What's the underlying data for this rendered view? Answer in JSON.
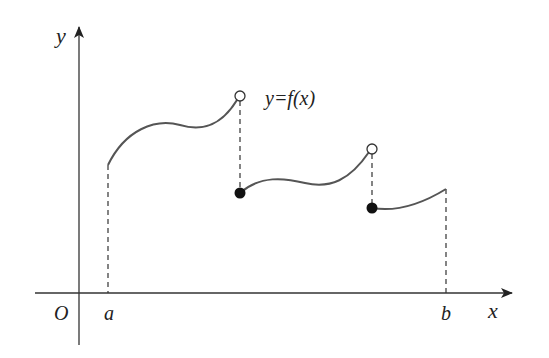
{
  "diagram": {
    "axes": {
      "x_label": "x",
      "y_label": "y",
      "origin_label": "O"
    },
    "points": {
      "a_label": "a",
      "b_label": "b"
    },
    "function_label": "y=f(x)",
    "colors": {
      "curve": "#555555",
      "axis": "#222222",
      "dash": "#333333"
    },
    "segments": [
      {
        "start": "a (closed, solid start)",
        "end": "open circle"
      },
      {
        "start": "filled circle",
        "end": "open circle"
      },
      {
        "start": "filled circle",
        "end": "b"
      }
    ]
  }
}
